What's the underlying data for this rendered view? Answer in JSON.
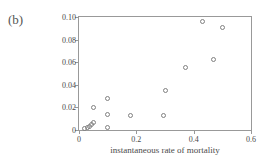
{
  "panel": {
    "label": "(b)"
  },
  "chart_data": {
    "type": "scatter",
    "title": "",
    "xlabel": "instantaneous rate of mortality",
    "ylabel": "rate of mortality senescence",
    "xlim": [
      0,
      0.6
    ],
    "ylim": [
      0,
      0.1
    ],
    "xticks": [
      0,
      0.2,
      0.4,
      0.6
    ],
    "xtick_labels": [
      "0",
      "0.2",
      "0.4",
      "0.6"
    ],
    "yticks": [
      0,
      0.02,
      0.04,
      0.06,
      0.08,
      0.1
    ],
    "ytick_labels": [
      "0",
      "0.02",
      "0.04",
      "0.06",
      "0.08",
      "0.10"
    ],
    "grid": false,
    "legend": false,
    "marker": "open-circle",
    "marker_color": "#808080",
    "frame_color": "#999999",
    "points": [
      {
        "x": 0.02,
        "y": 0.001
      },
      {
        "x": 0.03,
        "y": 0.002
      },
      {
        "x": 0.038,
        "y": 0.003
      },
      {
        "x": 0.045,
        "y": 0.005
      },
      {
        "x": 0.05,
        "y": 0.007
      },
      {
        "x": 0.05,
        "y": 0.0195
      },
      {
        "x": 0.1,
        "y": 0.002
      },
      {
        "x": 0.1,
        "y": 0.014
      },
      {
        "x": 0.1,
        "y": 0.028
      },
      {
        "x": 0.18,
        "y": 0.013
      },
      {
        "x": 0.295,
        "y": 0.0125
      },
      {
        "x": 0.3,
        "y": 0.035
      },
      {
        "x": 0.37,
        "y": 0.055
      },
      {
        "x": 0.43,
        "y": 0.096
      },
      {
        "x": 0.47,
        "y": 0.062
      },
      {
        "x": 0.5,
        "y": 0.091
      }
    ]
  }
}
